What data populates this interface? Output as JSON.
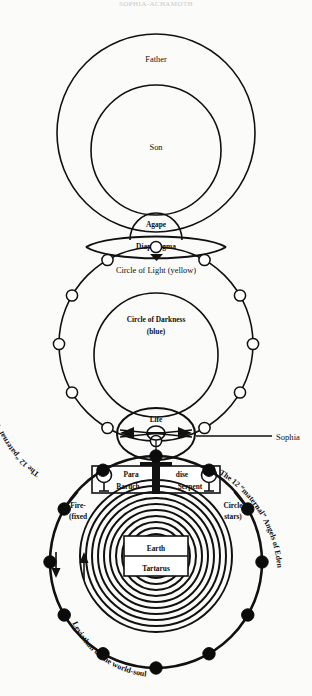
{
  "page": {
    "title_faint": "SOPHIA-ACHAMOTH",
    "background": "#ffffff",
    "ink": "#111111"
  },
  "labels": {
    "father": "Father",
    "son": "Son",
    "agape": "Agape",
    "diaphragma": "Diaphragma",
    "circle_of_light": "Circle of Light   (yellow)",
    "circle_of_darkness": "Circle of Darkness",
    "circle_of_darkness_color": "(blue)",
    "life": "Life",
    "sophia": "Sophia",
    "paradise_left": "Para",
    "paradise_right": "dise",
    "baruch": "Baruch",
    "serpent": "Serpent",
    "earth": "Earth",
    "tartarus": "Tartarus",
    "fire_line1": "Fire-",
    "fire_line2": "(fixed",
    "circle_line1": "Circle",
    "circle_line2": "stars)",
    "angels_elohim": "The 12 “paternal” Angels of Elohim",
    "angels_eden": "The 12 “maternal” Angels of Eden",
    "leviathan": "Leviathan or the world-soul"
  },
  "counts": {
    "open_nodes_on_light_circle": 12,
    "filled_nodes_on_eden_circle": 12,
    "concentric_rings_earth": 11
  }
}
